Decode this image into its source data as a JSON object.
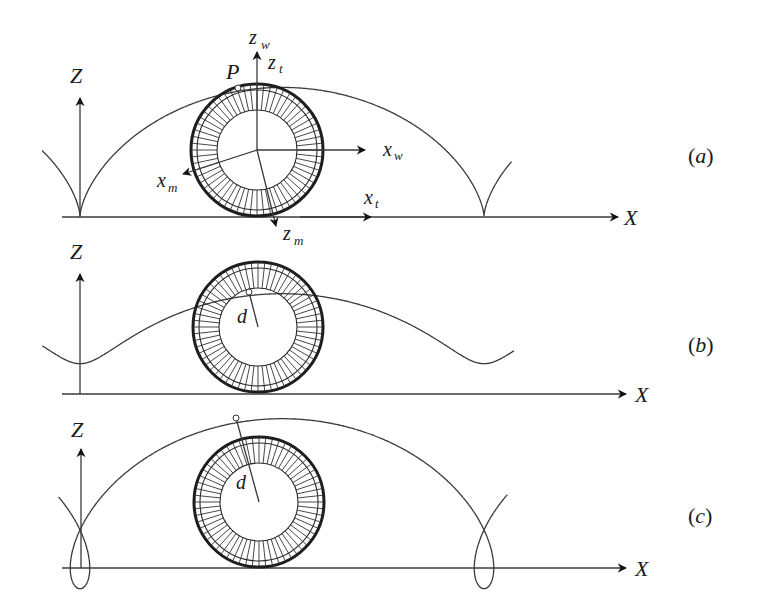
{
  "figure": {
    "panels": [
      {
        "id": "a",
        "label": "(a)",
        "axis_z": "Z",
        "axis_x": "X",
        "ground_y": 216,
        "wheel": {
          "cx": 257,
          "cy": 150,
          "r_outer": 66,
          "r_inner": 40
        },
        "curve": {
          "type": "cycloid",
          "x_start": 80,
          "rolling_radius": 64.3,
          "tracing_distance": 64.3,
          "x_from": 42,
          "x_to": 512
        },
        "point_label": "P",
        "point": {
          "x": 238,
          "y": 88
        },
        "frame_labels": {
          "z_w": "z",
          "z_w_sub": "w",
          "z_t": "z",
          "z_t_sub": "t",
          "x_w": "x",
          "x_w_sub": "w",
          "x_t": "x",
          "x_t_sub": "t",
          "x_m": "x",
          "x_m_sub": "m",
          "z_m": "z",
          "z_m_sub": "m"
        }
      },
      {
        "id": "b",
        "label": "(b)",
        "axis_z": "Z",
        "axis_x": "X",
        "ground_y": 393,
        "wheel": {
          "cx": 258,
          "cy": 327,
          "r_outer": 65,
          "r_inner": 39
        },
        "curve": {
          "type": "curtate trochoid",
          "x_start": 80,
          "rolling_radius": 64.3,
          "tracing_distance": 35,
          "x_from": 42,
          "x_to": 514
        },
        "distance_label": "d",
        "point": {
          "x": 249,
          "y": 292
        }
      },
      {
        "id": "c",
        "label": "(c)",
        "axis_z": "Z",
        "axis_x": "X",
        "ground_y": 568,
        "wheel": {
          "cx": 259,
          "cy": 502,
          "r_outer": 65,
          "r_inner": 39
        },
        "curve": {
          "type": "prolate trochoid",
          "x_start": 80,
          "rolling_radius": 64.3,
          "tracing_distance": 85,
          "x_from": 58,
          "x_to": 508
        },
        "distance_label": "d",
        "point": {
          "x": 236,
          "y": 418
        }
      }
    ]
  }
}
